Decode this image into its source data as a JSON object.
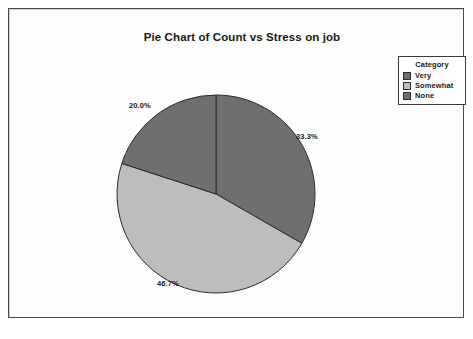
{
  "chart_data": {
    "type": "pie",
    "title": "Pie Chart of Count vs Stress on job",
    "xlabel": "",
    "ylabel": "",
    "legend_position": "top-right",
    "legend_title": "Category",
    "start_angle_deg": 0,
    "direction": "clockwise",
    "categories": [
      "Very",
      "Somewhat",
      "None"
    ],
    "values": [
      33.3,
      46.7,
      20.0
    ],
    "labels": [
      "33.3%",
      "46.7%",
      "20.0%"
    ],
    "colors": [
      "#6f6f6f",
      "#bdbdbd",
      "#6f6f6f"
    ]
  },
  "chart": {
    "title": "Pie Chart of Count vs Stress on job",
    "slices": [
      {
        "name": "Very",
        "label": "33.3%",
        "value": 33.3,
        "color": "#6f6f6f"
      },
      {
        "name": "Somewhat",
        "label": "46.7%",
        "value": 46.7,
        "color": "#bdbdbd"
      },
      {
        "name": "None",
        "label": "20.0%",
        "value": 20.0,
        "color": "#6f6f6f"
      }
    ]
  },
  "legend": {
    "title": "Category",
    "items": [
      {
        "label": "Very",
        "color": "#6f6f6f"
      },
      {
        "label": "Somewhat",
        "color": "#bdbdbd"
      },
      {
        "label": "None",
        "color": "#6f6f6f"
      }
    ]
  },
  "style": {
    "slice_outline": "#2b2b2b",
    "frame_border": "#4a4a4a",
    "background": "#ffffff",
    "text_color": "#1a1a1a"
  }
}
